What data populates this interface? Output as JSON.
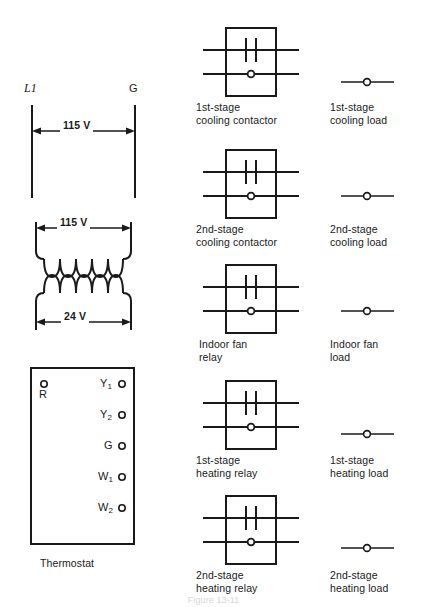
{
  "figure": {
    "caption": "Figure 13-11",
    "supply": {
      "left_terminal_label": "L1",
      "right_terminal_label": "G",
      "voltage_label": "115 V"
    },
    "transformer": {
      "primary_voltage_label": "115 V",
      "secondary_voltage_label": "24 V"
    },
    "thermostat": {
      "caption": "Thermostat",
      "left_terminals": [
        {
          "name": "R",
          "symbol": "terminal-dot"
        }
      ],
      "right_terminals": [
        {
          "name": "Y",
          "subscript": "1",
          "symbol": "terminal-dot"
        },
        {
          "name": "Y",
          "subscript": "2",
          "symbol": "terminal-dot"
        },
        {
          "name": "G",
          "subscript": "",
          "symbol": "terminal-dot"
        },
        {
          "name": "W",
          "subscript": "1",
          "symbol": "terminal-dot"
        },
        {
          "name": "W",
          "subscript": "2",
          "symbol": "terminal-dot"
        }
      ]
    },
    "devices": [
      {
        "coil_label_line1": "1st-stage",
        "coil_label_line2": "cooling contactor",
        "load_label_line1": "1st-stage",
        "load_label_line2": "cooling load"
      },
      {
        "coil_label_line1": "2nd-stage",
        "coil_label_line2": "cooling contactor",
        "load_label_line1": "2nd-stage",
        "load_label_line2": "cooling load"
      },
      {
        "coil_label_line1": "Indoor fan",
        "coil_label_line2": "relay",
        "load_label_line1": "Indoor fan",
        "load_label_line2": "load"
      },
      {
        "coil_label_line1": "1st-stage",
        "coil_label_line2": "heating relay",
        "load_label_line1": "1st-stage",
        "load_label_line2": "heating load"
      },
      {
        "coil_label_line1": "2nd-stage",
        "coil_label_line2": "heating relay",
        "load_label_line1": "2nd-stage",
        "load_label_line2": "heating load"
      }
    ]
  },
  "colors": {
    "ink": "#1a1a1a",
    "paper": "#ffffff"
  }
}
